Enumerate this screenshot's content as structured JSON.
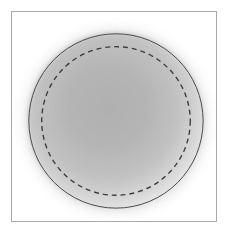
{
  "figure": {
    "title": "",
    "width": 232,
    "height": 240,
    "background_color": "#ffffff"
  },
  "frame": {
    "border_color": "#a9a9a9",
    "border_width": 1,
    "fill_color": "#ffffff",
    "x": 11,
    "y": 11,
    "width": 206,
    "height": 211
  },
  "chart_data": {
    "type": "scatter",
    "title": "",
    "subtitle": "",
    "xlabel": "",
    "ylabel": "",
    "grid": false,
    "legend": null,
    "axis_ticks_visible": false,
    "tick_labels": [],
    "annotations": [],
    "xlim": [
      0,
      206
    ],
    "ylim": [
      0,
      211
    ],
    "shapes": [
      {
        "name": "blurred-halo-disk",
        "kind": "circle",
        "cx": 105,
        "cy": 110,
        "r": 92,
        "fill": "#c9c9c9",
        "stroke": "none",
        "blur": 7,
        "opacity": 0.55
      },
      {
        "name": "gradient-disk-fill",
        "kind": "circle",
        "cx": 105,
        "cy": 110,
        "r": 89,
        "fill": "radial-gradient",
        "gradient_inner_color": "#b2b2b2",
        "gradient_mid_color": "#c5c5c5",
        "gradient_outer_color": "#ececec",
        "stroke": "none"
      },
      {
        "name": "solid-outline-circle",
        "kind": "circle",
        "cx": 105,
        "cy": 110,
        "r": 88,
        "fill": "none",
        "stroke": "#4a4a4a",
        "stroke_width": 1,
        "dash": "solid"
      },
      {
        "name": "dashed-inner-circle",
        "kind": "circle",
        "cx": 105,
        "cy": 110,
        "r": 75,
        "fill": "none",
        "stroke": "#3d3d3d",
        "stroke_width": 1.4,
        "dash": "dashed",
        "dash_pattern": "5 4"
      }
    ],
    "colors": {
      "disk_center": "#b2b2b2",
      "disk_edge": "#ececec",
      "outline": "#4a4a4a",
      "dashed_outline": "#3d3d3d",
      "frame_border": "#a9a9a9",
      "background": "#ffffff"
    }
  }
}
